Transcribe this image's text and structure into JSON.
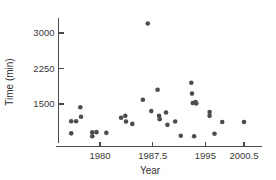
{
  "chart_data": {
    "type": "scatter",
    "title": "",
    "xlabel": "Year",
    "ylabel": "Time (min)",
    "xlim": [
      1975.2,
      2002.6
    ],
    "ylim": [
      600,
      3400
    ],
    "grid": false,
    "legend": null,
    "xticks": [
      1980,
      1987.5,
      1995,
      2000.5
    ],
    "xtick_labels": [
      "1980",
      "1987.5",
      "1995",
      "2000.5"
    ],
    "yticks": [
      1500,
      2250,
      3000
    ],
    "ytick_labels": [
      "1500",
      "2250",
      "3000"
    ],
    "marker": "filled-circle",
    "marker_color": "#4d4d4d",
    "points": [
      {
        "x": 1975.9,
        "y": 1135
      },
      {
        "x": 1975.9,
        "y": 880
      },
      {
        "x": 1976.6,
        "y": 1135
      },
      {
        "x": 1977.2,
        "y": 1430
      },
      {
        "x": 1977.3,
        "y": 1230
      },
      {
        "x": 1978.9,
        "y": 900
      },
      {
        "x": 1978.9,
        "y": 820
      },
      {
        "x": 1979.5,
        "y": 905
      },
      {
        "x": 1980.9,
        "y": 890
      },
      {
        "x": 1983.0,
        "y": 1210
      },
      {
        "x": 1983.6,
        "y": 1250
      },
      {
        "x": 1983.7,
        "y": 1130
      },
      {
        "x": 1984.6,
        "y": 1080
      },
      {
        "x": 1986.1,
        "y": 1590
      },
      {
        "x": 1986.8,
        "y": 3200
      },
      {
        "x": 1987.3,
        "y": 1350
      },
      {
        "x": 1988.2,
        "y": 1800
      },
      {
        "x": 1988.4,
        "y": 1250
      },
      {
        "x": 1988.5,
        "y": 1180
      },
      {
        "x": 1989.4,
        "y": 1320
      },
      {
        "x": 1989.6,
        "y": 1060
      },
      {
        "x": 1990.7,
        "y": 1130
      },
      {
        "x": 1991.5,
        "y": 830
      },
      {
        "x": 1993.0,
        "y": 1950
      },
      {
        "x": 1993.1,
        "y": 1720
      },
      {
        "x": 1993.2,
        "y": 1520
      },
      {
        "x": 1993.6,
        "y": 1540
      },
      {
        "x": 1993.7,
        "y": 1510
      },
      {
        "x": 1993.4,
        "y": 820
      },
      {
        "x": 1995.6,
        "y": 1330
      },
      {
        "x": 1995.6,
        "y": 1250
      },
      {
        "x": 1996.3,
        "y": 870
      },
      {
        "x": 1997.4,
        "y": 1120
      },
      {
        "x": 2000.5,
        "y": 1120
      }
    ]
  }
}
